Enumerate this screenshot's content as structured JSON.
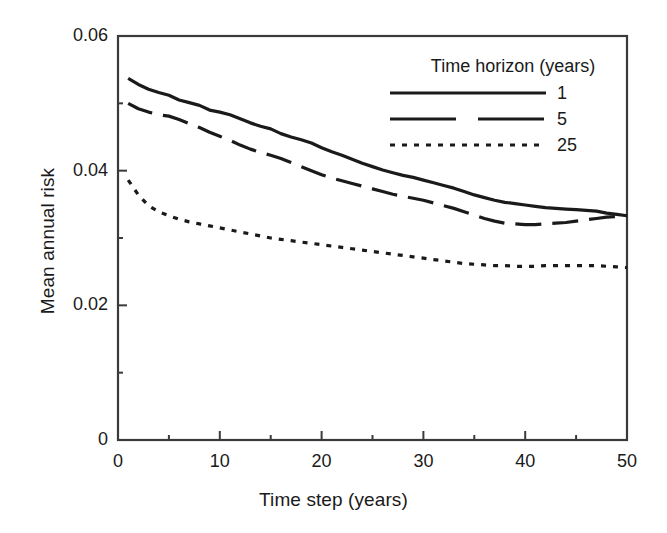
{
  "chart_data": {
    "type": "line",
    "title": "",
    "xlabel": "Time step (years)",
    "ylabel": "Mean annual risk",
    "xlim": [
      0,
      50
    ],
    "ylim": [
      0,
      0.06
    ],
    "x_ticks": [
      "0",
      "10",
      "20",
      "30",
      "40",
      "50"
    ],
    "x_tick_values": [
      0,
      10,
      20,
      30,
      40,
      50
    ],
    "x_minor_ticks": [
      5,
      15,
      25,
      35,
      45
    ],
    "y_ticks": [
      "0",
      "0.02",
      "0.04",
      "0.06"
    ],
    "y_tick_values": [
      0,
      0.02,
      0.04,
      0.06
    ],
    "y_minor_ticks": [
      0.01,
      0.03,
      0.05
    ],
    "grid": false,
    "legend_position": "upper right",
    "legend_title": "Time horizon (years)",
    "x": [
      1,
      2,
      3,
      4,
      5,
      6,
      7,
      8,
      9,
      10,
      11,
      12,
      13,
      14,
      15,
      16,
      17,
      18,
      19,
      20,
      21,
      22,
      23,
      24,
      25,
      26,
      27,
      28,
      29,
      30,
      31,
      32,
      33,
      34,
      35,
      36,
      37,
      38,
      39,
      40,
      41,
      42,
      43,
      44,
      45,
      46,
      47,
      48,
      49,
      50
    ],
    "series": [
      {
        "name": "1",
        "label": "1",
        "style": "solid",
        "color": "#1a1a1a",
        "values": [
          0.0537,
          0.0528,
          0.0521,
          0.0516,
          0.0512,
          0.0505,
          0.0501,
          0.0497,
          0.049,
          0.0487,
          0.0483,
          0.0477,
          0.0471,
          0.0466,
          0.0462,
          0.0455,
          0.045,
          0.0446,
          0.0441,
          0.0434,
          0.0428,
          0.0423,
          0.0417,
          0.0411,
          0.0406,
          0.0401,
          0.0397,
          0.0393,
          0.039,
          0.0386,
          0.0382,
          0.0378,
          0.0374,
          0.0369,
          0.0364,
          0.036,
          0.0356,
          0.0353,
          0.0351,
          0.0349,
          0.0347,
          0.0345,
          0.0344,
          0.0343,
          0.0342,
          0.0341,
          0.034,
          0.0337,
          0.0335,
          0.0333
        ]
      },
      {
        "name": "5",
        "label": "5",
        "style": "dashed",
        "color": "#1a1a1a",
        "values": [
          0.05,
          0.0492,
          0.0487,
          0.0483,
          0.0481,
          0.0476,
          0.047,
          0.0464,
          0.0457,
          0.0451,
          0.0445,
          0.0438,
          0.0432,
          0.0427,
          0.0423,
          0.0418,
          0.0412,
          0.0406,
          0.04,
          0.0394,
          0.0389,
          0.0385,
          0.0381,
          0.0377,
          0.0373,
          0.0369,
          0.0365,
          0.0362,
          0.0359,
          0.0356,
          0.0352,
          0.0348,
          0.0344,
          0.0339,
          0.0334,
          0.0329,
          0.0325,
          0.0322,
          0.0321,
          0.032,
          0.032,
          0.0321,
          0.0322,
          0.0323,
          0.0325,
          0.0327,
          0.0329,
          0.0331,
          0.0332,
          0.0333
        ]
      },
      {
        "name": "25",
        "label": "25",
        "style": "dotted",
        "color": "#1a1a1a",
        "values": [
          0.0386,
          0.0364,
          0.0348,
          0.0339,
          0.0333,
          0.0328,
          0.0324,
          0.0321,
          0.0318,
          0.0315,
          0.0312,
          0.0309,
          0.0306,
          0.0303,
          0.03,
          0.0298,
          0.0296,
          0.0294,
          0.0292,
          0.029,
          0.0288,
          0.0286,
          0.0284,
          0.0282,
          0.028,
          0.0278,
          0.0276,
          0.0274,
          0.0272,
          0.027,
          0.0268,
          0.0266,
          0.0264,
          0.0262,
          0.0261,
          0.026,
          0.0259,
          0.0259,
          0.0258,
          0.0258,
          0.0258,
          0.0259,
          0.0259,
          0.0259,
          0.0259,
          0.0259,
          0.0259,
          0.0258,
          0.0257,
          0.0256
        ]
      }
    ]
  }
}
